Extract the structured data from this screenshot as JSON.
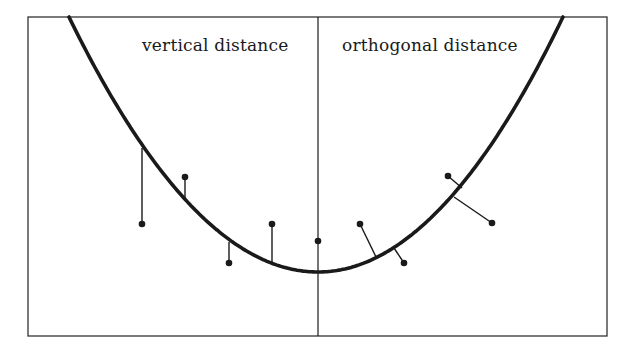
{
  "figure": {
    "labels": {
      "left": "vertical distance",
      "right": "orthogonal distance"
    },
    "colors": {
      "background": "#ffffff",
      "ink": "#1a1a1a",
      "frame": "#333333"
    },
    "frame": {
      "x": 28,
      "y": 17,
      "width": 579,
      "height": 319
    },
    "divider_x": 318,
    "curve": {
      "type": "parabola",
      "vertex": [
        318,
        272
      ],
      "left_exit": [
        69,
        17
      ],
      "right_exit": [
        563,
        17
      ]
    },
    "vertical_distance_points": [
      {
        "point": [
          142,
          224
        ],
        "foot": [
          142,
          148
        ]
      },
      {
        "point": [
          185,
          177
        ],
        "foot": [
          185,
          200
        ]
      },
      {
        "point": [
          229,
          263
        ],
        "foot": [
          229,
          242
        ]
      },
      {
        "point": [
          272,
          224
        ],
        "foot": [
          272,
          264
        ]
      }
    ],
    "center_point": [
      318,
      241
    ],
    "orthogonal_distance_points": [
      {
        "point": [
          360,
          224
        ],
        "foot": [
          377,
          259
        ]
      },
      {
        "point": [
          404,
          263
        ],
        "foot": [
          394,
          248
        ]
      },
      {
        "point": [
          448,
          176
        ],
        "foot": [
          462,
          188
        ]
      },
      {
        "point": [
          492,
          223
        ],
        "foot": [
          454,
          197
        ]
      }
    ]
  }
}
